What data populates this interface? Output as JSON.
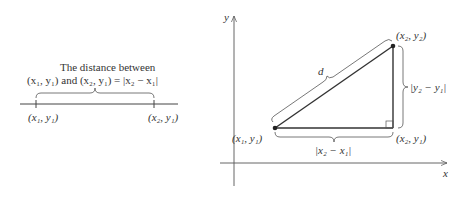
{
  "left_panel": {
    "caption_line1": "The distance between",
    "caption_line2": "(x₁, y₁) and (x₂, y₁) = |x₂ − x₁|",
    "point_left": "(x₁, y₁)",
    "point_right": "(x₂, y₁)"
  },
  "right_panel": {
    "y_axis_label": "y",
    "x_axis_label": "x",
    "point_p1": "(x₁, y₁)",
    "point_p2": "(x₂, y₂)",
    "point_corner": "(x₂, y₁)",
    "hypotenuse_label": "d",
    "vertical_label": "|y₂ − y₁|",
    "horizontal_label": "|x₂ − x₁|"
  },
  "colors": {
    "line": "#333333",
    "axis": "#555555"
  }
}
